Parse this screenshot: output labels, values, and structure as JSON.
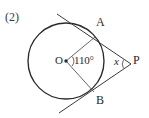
{
  "figure": {
    "problem_number": "(2)",
    "background_color": "#ffffff",
    "stroke_color": "#2a2a2a",
    "type": "circle-tangent-geometry-diagram",
    "labels": {
      "center_point": "O",
      "central_angle": "110°",
      "tangent_point_upper": "A",
      "tangent_point_lower": "B",
      "external_point": "P",
      "unknown_angle": "x"
    },
    "geometry": {
      "circle": {
        "cx": 66,
        "cy": 61,
        "r": 38
      },
      "point_O": {
        "x": 66,
        "y": 61
      },
      "point_A": {
        "x": 95,
        "y": 37
      },
      "point_B": {
        "x": 94,
        "y": 92
      },
      "point_P": {
        "x": 131,
        "y": 64
      },
      "tangent_upper_far": {
        "x": 57,
        "y": 14
      },
      "tangent_lower_far": {
        "x": 59,
        "y": 113
      },
      "central_angle_degrees": 110,
      "unknown_angle_at_P": "x"
    }
  }
}
